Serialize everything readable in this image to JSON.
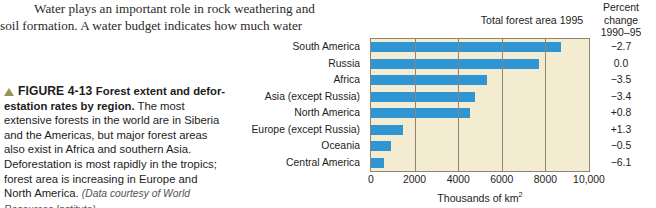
{
  "body_text": {
    "paragraph_line1": "Water plays an important role in rock weathering and",
    "paragraph_line2": "soil formation. A water budget indicates how much water"
  },
  "caption": {
    "marker": "triangle-up",
    "figure_label": "FIGURE 4-13",
    "title": "Forest extent and defor-estation rates by region.",
    "body": "The most extensive forests in the world are in Siberia and the Americas, but major forest areas also exist in Africa and southern Asia. Deforestation is most rapidly in the tropics; forest area is increasing in Europe and North America.",
    "source": "(Data courtesy of World Resources Institute)"
  },
  "chart_data": {
    "type": "bar",
    "orientation": "horizontal",
    "title": "Total forest area 1995",
    "xlabel": "Thousands of km2",
    "xlabel_display": "Thousands of km",
    "xlabel_superscript": "2",
    "ylabel": "",
    "xlim": [
      0,
      10000
    ],
    "xticks": [
      0,
      2000,
      4000,
      6000,
      8000,
      10000
    ],
    "xtick_labels": [
      "0",
      "2000",
      "4000",
      "6000",
      "8000",
      "10,000"
    ],
    "grid": true,
    "legend": false,
    "bar_color": "#2f95d3",
    "plot_background": "#f3ecd0",
    "categories": [
      "South America",
      "Russia",
      "Africa",
      "Asia (except Russia)",
      "North America",
      "Europe (except Russia)",
      "Oceania",
      "Central America"
    ],
    "values": [
      8700,
      7700,
      5300,
      4750,
      4550,
      1450,
      900,
      600
    ],
    "secondary_column": {
      "header_line1": "Percent",
      "header_line2": "change",
      "header_line3": "1990–95",
      "values": [
        "−2.7",
        "0.0",
        "−3.5",
        "−3.4",
        "+0.8",
        "+1.3",
        "−0.5",
        "−6.1"
      ]
    }
  }
}
